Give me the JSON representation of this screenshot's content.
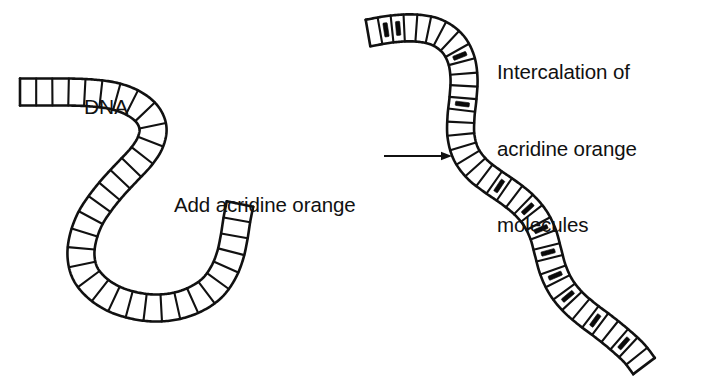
{
  "figure": {
    "background_color": "#ffffff",
    "ink_color": "#111111",
    "intercalator_color": "#0a0a0a",
    "width": 715,
    "height": 381
  },
  "labels": {
    "dna": "DNA",
    "add_reagent": "Add acridine orange",
    "result_line1": "Intercalation of",
    "result_line2": "acridine orange",
    "result_line3": "molecules"
  },
  "arrow": {
    "name": "reaction-arrow",
    "direction": "right",
    "x_start": 384,
    "x_end": 452,
    "y": 156,
    "head_length": 11,
    "head_half_width": 4.2
  },
  "strands": [
    {
      "id": "dna-plain",
      "name": "dna-strand-plain",
      "caption": "DNA",
      "rung_count": 34,
      "ladder_width": 27,
      "points": [
        [
          20,
          92
        ],
        [
          44,
          92
        ],
        [
          68,
          92
        ],
        [
          92,
          93
        ],
        [
          114,
          96
        ],
        [
          133,
          103
        ],
        [
          147,
          114
        ],
        [
          153,
          128
        ],
        [
          150,
          143
        ],
        [
          141,
          157
        ],
        [
          128,
          171
        ],
        [
          114,
          186
        ],
        [
          101,
          202
        ],
        [
          90,
          219
        ],
        [
          83,
          238
        ],
        [
          81,
          256
        ],
        [
          85,
          273
        ],
        [
          96,
          287
        ],
        [
          112,
          298
        ],
        [
          132,
          305
        ],
        [
          154,
          308
        ],
        [
          176,
          306
        ],
        [
          196,
          299
        ],
        [
          212,
          288
        ],
        [
          223,
          273
        ],
        [
          230,
          256
        ],
        [
          234,
          238
        ],
        [
          237,
          219
        ],
        [
          240,
          204
        ]
      ],
      "intercalators": []
    },
    {
      "id": "dna-intercalated",
      "name": "dna-strand-intercalated",
      "caption": "Intercalation of acridine orange molecules",
      "rung_count": 40,
      "ladder_width": 27,
      "points": [
        [
          368,
          33
        ],
        [
          392,
          29
        ],
        [
          415,
          28
        ],
        [
          436,
          32
        ],
        [
          452,
          43
        ],
        [
          461,
          59
        ],
        [
          464,
          78
        ],
        [
          463,
          98
        ],
        [
          461,
          117
        ],
        [
          461,
          136
        ],
        [
          466,
          154
        ],
        [
          477,
          169
        ],
        [
          492,
          181
        ],
        [
          508,
          192
        ],
        [
          523,
          204
        ],
        [
          535,
          218
        ],
        [
          543,
          234
        ],
        [
          548,
          252
        ],
        [
          553,
          270
        ],
        [
          561,
          287
        ],
        [
          573,
          302
        ],
        [
          588,
          315
        ],
        [
          604,
          327
        ],
        [
          620,
          340
        ],
        [
          634,
          353
        ],
        [
          644,
          366
        ]
      ],
      "intercalators": [
        1,
        2,
        8,
        12,
        20,
        23,
        25,
        27,
        29,
        31,
        34,
        37
      ]
    }
  ],
  "intercalator_glyph": {
    "name": "acridine-orange-bar",
    "width_ratio": 0.16,
    "length_ratio": 0.52
  }
}
